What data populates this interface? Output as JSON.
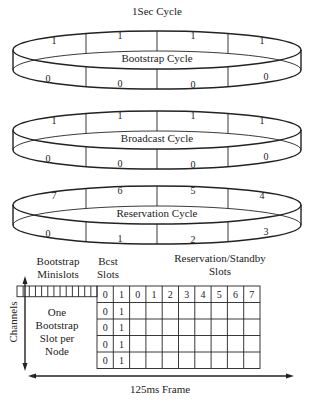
{
  "title": "1Sec Cycle",
  "rings": [
    {
      "label": "Bootstrap Cycle",
      "top_values": [
        "1",
        "1",
        "1",
        "1"
      ],
      "bottom_values": [
        "0",
        "0",
        "0",
        "0"
      ]
    },
    {
      "label": "Broadcast Cycle",
      "top_values": [
        "1",
        "1",
        "1",
        "1"
      ],
      "bottom_values": [
        "0",
        "0",
        "0",
        "0"
      ]
    },
    {
      "label": "Reservation Cycle",
      "top_values": [
        "7",
        "6",
        "5",
        "4"
      ],
      "bottom_values": [
        "0",
        "1",
        "2",
        "3"
      ]
    }
  ],
  "frame": {
    "bootstrap_header": [
      "Bootstrap",
      "Minislots"
    ],
    "bcst_header": [
      "Bcst",
      "Slots"
    ],
    "reservation_header": [
      "Reservation/Standby",
      "Slots"
    ],
    "bcst_slot_labels": [
      "0",
      "1"
    ],
    "reservation_slot_labels": [
      "0",
      "1",
      "2",
      "3",
      "4",
      "5",
      "6",
      "7"
    ],
    "bcst_rows": [
      [
        "0",
        "1"
      ],
      [
        "0",
        "1"
      ],
      [
        "0",
        "1"
      ],
      [
        "0",
        "1"
      ]
    ],
    "bootstrap_note": [
      "One",
      "Bootstrap",
      "Slot per",
      "Node"
    ],
    "minislot_count": 13,
    "y_axis_label": "Channels",
    "x_axis_label": "125ms Frame"
  }
}
